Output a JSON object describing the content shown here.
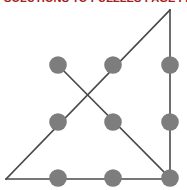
{
  "header": {
    "title": "SOLUTIONS TO PUZZLES PAGE FIVE",
    "color": "#a32020"
  },
  "figure": {
    "name": "nine-dot-triangle-solution",
    "background": "#ffffff",
    "dot_color": "#7d7d7d",
    "line_color": "#4a4a4a",
    "dot_radius": 8.8,
    "line_width": 1.6,
    "canvas": {
      "width": 187,
      "height": 190
    },
    "dots": [
      {
        "id": "dot-r1c1",
        "row": 1,
        "col": 1,
        "cx": 58,
        "cy": 65
      },
      {
        "id": "dot-r1c2",
        "row": 1,
        "col": 2,
        "cx": 113,
        "cy": 65
      },
      {
        "id": "dot-r1c3",
        "row": 1,
        "col": 3,
        "cx": 170,
        "cy": 65
      },
      {
        "id": "dot-r2c1",
        "row": 2,
        "col": 1,
        "cx": 58,
        "cy": 122
      },
      {
        "id": "dot-r2c2",
        "row": 2,
        "col": 2,
        "cx": 113,
        "cy": 122
      },
      {
        "id": "dot-r2c3",
        "row": 2,
        "col": 3,
        "cx": 170,
        "cy": 122
      },
      {
        "id": "dot-r3c1",
        "row": 3,
        "col": 1,
        "cx": 58,
        "cy": 178
      },
      {
        "id": "dot-r3c2",
        "row": 3,
        "col": 2,
        "cx": 113,
        "cy": 178
      },
      {
        "id": "dot-r3c3",
        "row": 3,
        "col": 3,
        "cx": 170,
        "cy": 178
      }
    ],
    "segments": [
      {
        "id": "segment-bottom",
        "x1": 6,
        "y1": 179,
        "x2": 171,
        "y2": 179
      },
      {
        "id": "segment-right-vertical",
        "x1": 170,
        "y1": 10,
        "x2": 170,
        "y2": 179
      },
      {
        "id": "segment-long-diagonal",
        "x1": 6,
        "y1": 179,
        "x2": 170,
        "y2": 10
      },
      {
        "id": "segment-short-diagonal",
        "x1": 56,
        "y1": 63,
        "x2": 171,
        "y2": 179
      }
    ],
    "crossing_point": {
      "x": 88,
      "y": 95
    }
  }
}
